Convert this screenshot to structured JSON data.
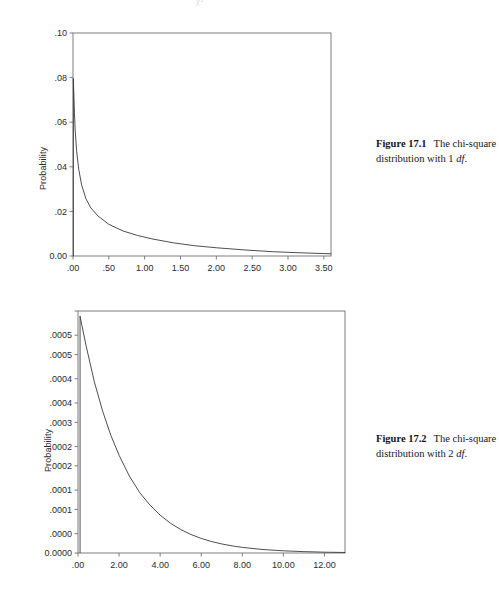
{
  "page": {
    "header_mark": "χ²"
  },
  "figures": [
    {
      "id": "figure-1",
      "caption": {
        "label": "Figure 17.1",
        "text_before": "The chi-square distribution with 1 ",
        "df": "df",
        "text_after": "."
      },
      "chart_data": {
        "type": "line",
        "title": "",
        "subtitle": "",
        "xlabel": "",
        "ylabel": "Probability",
        "xlim": [
          0.0,
          3.6
        ],
        "ylim": [
          0.0,
          0.1
        ],
        "grid": false,
        "legend": null,
        "x_ticks": [
          0.0,
          0.5,
          1.0,
          1.5,
          2.0,
          2.5,
          3.0,
          3.5
        ],
        "x_tick_labels": [
          ".00",
          ".50",
          "1.00",
          "1.50",
          "2.00",
          "2.50",
          "3.00",
          "3.50"
        ],
        "y_ticks": [
          0.0,
          0.02,
          0.04,
          0.06,
          0.08,
          0.1
        ],
        "y_tick_labels": [
          "0.00",
          ".02",
          ".04",
          ".06",
          ".08",
          ".10"
        ],
        "series": [
          {
            "name": "chi-square pdf, 1 df",
            "x": [
              0.005,
              0.01,
              0.02,
              0.03,
              0.05,
              0.08,
              0.12,
              0.18,
              0.25,
              0.35,
              0.5,
              0.7,
              0.9,
              1.1,
              1.4,
              1.7,
              2.0,
              2.4,
              2.8,
              3.2,
              3.6
            ],
            "y": [
              0.0795,
              0.0742,
              0.0645,
              0.0566,
              0.0472,
              0.0389,
              0.0319,
              0.0257,
              0.0215,
              0.0179,
              0.0142,
              0.0112,
              0.0092,
              0.0077,
              0.0059,
              0.0046,
              0.0037,
              0.0027,
              0.0019,
              0.0014,
              0.001
            ]
          }
        ]
      }
    },
    {
      "id": "figure-2",
      "caption": {
        "label": "Figure 17.2",
        "text_before": "The chi-square distribution with 2 ",
        "df": "df",
        "text_after": "."
      },
      "chart_data": {
        "type": "line",
        "title": "",
        "subtitle": "",
        "xlabel": "",
        "ylabel": "Probability",
        "xlim": [
          0.0,
          13.0
        ],
        "ylim": [
          0.0,
          0.0005
        ],
        "grid": false,
        "legend": null,
        "x_ticks": [
          0.0,
          2.0,
          4.0,
          6.0,
          8.0,
          10.0,
          12.0
        ],
        "x_tick_labels": [
          ".00",
          "2.00",
          "4.00",
          "6.00",
          "8.00",
          "10.00",
          "12.00"
        ],
        "y_ticks": [
          0.0,
          4e-05,
          9e-05,
          0.00013,
          0.00018,
          0.00022,
          0.00027,
          0.00031,
          0.00036,
          0.00041,
          0.00045,
          0.0005
        ],
        "y_tick_labels": [
          "0.0000",
          ".0000",
          ".0001",
          ".0001",
          ".0002",
          ".0002",
          ".0003",
          ".0004",
          ".0004",
          ".0005",
          ".0005"
        ],
        "series": [
          {
            "name": "chi-square pdf, 2 df",
            "x": [
              0.1,
              0.4,
              0.8,
              1.2,
              1.6,
              2.0,
              2.5,
              3.0,
              3.5,
              4.0,
              4.5,
              5.0,
              5.5,
              6.0,
              6.5,
              7.0,
              7.5,
              8.0,
              9.0,
              10.0,
              11.0,
              12.0,
              13.0
            ],
            "y": [
              0.000489,
              0.000427,
              0.000353,
              0.000293,
              0.000243,
              0.000202,
              0.000159,
              0.000125,
              9.93e-05,
              7.82e-05,
              6.16e-05,
              4.85e-05,
              3.82e-05,
              3.01e-05,
              2.37e-05,
              1.87e-05,
              1.47e-05,
              1.16e-05,
              7.2e-06,
              4.5e-06,
              2.8e-06,
              1.7e-06,
              1.1e-06
            ]
          }
        ]
      }
    }
  ]
}
